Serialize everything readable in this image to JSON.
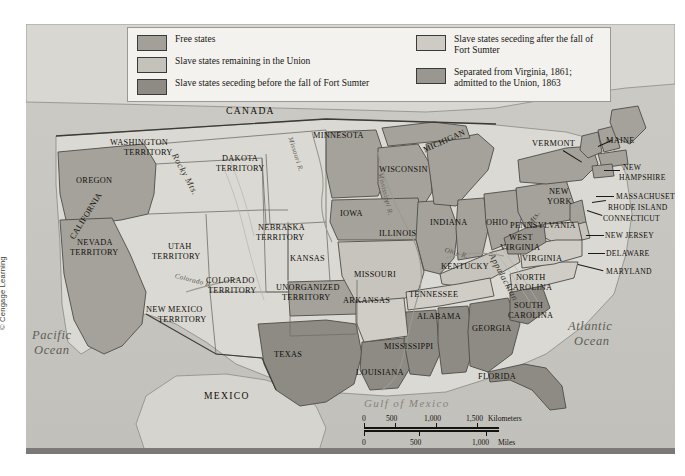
{
  "legend": {
    "columns": [
      {
        "items": [
          {
            "label": "Free states",
            "color": "#a3a099",
            "swatch": "free-states-swatch"
          },
          {
            "label": "Slave states remaining in the Union",
            "color": "#c4c2bb",
            "swatch": "slave-union-swatch"
          },
          {
            "label": "Slave states seceding before the fall of Fort Sumter",
            "color": "#8e8b84",
            "swatch": "seceding-before-swatch"
          }
        ]
      },
      {
        "items": [
          {
            "label": "Slave states seceding after the fall of Fort Sumter",
            "color": "#cdcbc4",
            "swatch": "seceding-after-swatch"
          },
          {
            "label": "Separated from Virginia, 1861; admitted to the Union, 1863",
            "color": "#9a9790",
            "swatch": "west-virginia-swatch"
          }
        ]
      }
    ]
  },
  "map": {
    "countries": [
      "CANADA",
      "MEXICO"
    ],
    "oceans": [
      "Pacific Ocean",
      "Atlantic Ocean"
    ],
    "gulf": "Gulf of Mexico",
    "rivers": [
      "Missouri R.",
      "Mississippi R.",
      "Ohio R.",
      "Colorado R."
    ],
    "mountains": [
      "Rocky Mts.",
      "Appalachian Mts."
    ],
    "states": [
      "OREGON",
      "CALIFORNIA",
      "WASHINGTON TERRITORY",
      "NEVADA TERRITORY",
      "UTAH TERRITORY",
      "DAKOTA TERRITORY",
      "COLORADO TERRITORY",
      "NEBRASKA TERRITORY",
      "NEW MEXICO TERRITORY",
      "UNORGANIZED TERRITORY",
      "KANSAS",
      "MINNESOTA",
      "WISCONSIN",
      "IOWA",
      "MISSOURI",
      "ARKANSAS",
      "TEXAS",
      "LOUISIANA",
      "MISSISSIPPI",
      "ALABAMA",
      "TENNESSEE",
      "KENTUCKY",
      "ILLINOIS",
      "INDIANA",
      "MICHIGAN",
      "OHIO",
      "GEORGIA",
      "FLORIDA",
      "SOUTH CAROLINA",
      "NORTH CAROLINA",
      "VIRGINIA",
      "WEST VIRGINIA",
      "MARYLAND",
      "DELAWARE",
      "NEW JERSEY",
      "PENNSYLVANIA",
      "NEW YORK",
      "CONNECTICUT",
      "RHODE ISLAND",
      "MASSACHUSETTS",
      "NEW HAMPSHIRE",
      "VERMONT",
      "MAINE"
    ]
  },
  "labels": {
    "canada": "CANADA",
    "mexico": "MEXICO",
    "pacific_ocean_1": "Pacific",
    "pacific_ocean_2": "Ocean",
    "atlantic_ocean_1": "Atlantic",
    "atlantic_ocean_2": "Ocean",
    "gulf_of_mexico": "Gulf of Mexico",
    "rocky_mts": "Rocky Mts.",
    "appalachian_mts": "Appalachian",
    "appalachian_mts_2": "Mts.",
    "missouri_river": "Missouri R.",
    "mississippi_river": "Mississippi R.",
    "ohio_river": "Ohio R.",
    "colorado_river": "Colorado R.",
    "oregon": "OREGON",
    "california": "CALIFORNIA",
    "washington_1": "WASHINGTON",
    "washington_2": "TERRITORY",
    "nevada_1": "NEVADA",
    "nevada_2": "TERRITORY",
    "utah_1": "UTAH",
    "utah_2": "TERRITORY",
    "dakota_1": "DAKOTA",
    "dakota_2": "TERRITORY",
    "colorado_1": "COLORADO",
    "colorado_2": "TERRITORY",
    "nebraska_1": "NEBRASKA",
    "nebraska_2": "TERRITORY",
    "newmexico_1": "NEW MEXICO",
    "newmexico_2": "TERRITORY",
    "unorganized_1": "UNORGANIZED",
    "unorganized_2": "TERRITORY",
    "kansas": "KANSAS",
    "minnesota": "MINNESOTA",
    "wisconsin": "WISCONSIN",
    "iowa": "IOWA",
    "missouri": "MISSOURI",
    "arkansas": "ARKANSAS",
    "texas": "TEXAS",
    "louisiana": "LOUISIANA",
    "mississippi": "MISSISSIPPI",
    "alabama": "ALABAMA",
    "tennessee": "TENNESSEE",
    "kentucky": "KENTUCKY",
    "illinois": "ILLINOIS",
    "indiana": "INDIANA",
    "michigan": "MICHIGAN",
    "ohio": "OHIO",
    "georgia": "GEORGIA",
    "florida": "FLORIDA",
    "south_carolina_1": "SOUTH",
    "south_carolina_2": "CAROLINA",
    "north_carolina_1": "NORTH",
    "north_carolina_2": "CAROLINA",
    "virginia": "VIRGINIA",
    "west_virginia_1": "WEST",
    "west_virginia_2": "VIRGINIA",
    "maryland": "MARYLAND",
    "delaware": "DELAWARE",
    "new_jersey": "NEW JERSEY",
    "pennsylvania": "PENNSYLVANIA",
    "new_york_1": "NEW",
    "new_york_2": "YORK",
    "connecticut": "CONNECTICUT",
    "rhode_island": "RHODE ISLAND",
    "massachusetts": "MASSACHUSETTS",
    "new_hampshire_1": "NEW",
    "new_hampshire_2": "HAMPSHIRE",
    "vermont": "VERMONT",
    "maine": "MAINE"
  },
  "scale": {
    "km": {
      "ticks": [
        "0",
        "500",
        "1,000",
        "1,500"
      ],
      "unit": "Kilometers"
    },
    "mi": {
      "ticks": [
        "0",
        "500",
        "1,000"
      ],
      "unit": "Miles"
    }
  },
  "credit": "© Cengage Learning"
}
